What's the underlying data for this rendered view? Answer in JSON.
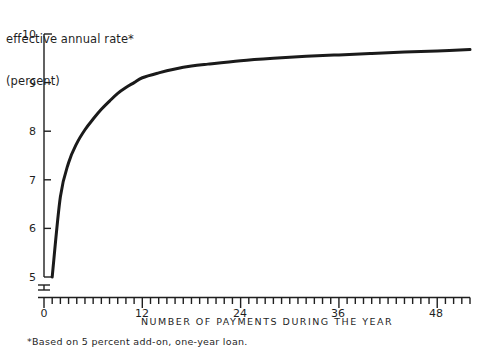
{
  "title": {
    "line1": "effective annual rate*",
    "line2": "(percent)"
  },
  "xaxis_caption": "NUMBER OF PAYMENTS DURING THE YEAR",
  "footnote": "*Based on 5 percent add-on, one-year loan.",
  "chart_data": {
    "type": "line",
    "title": "effective annual rate* (percent)",
    "subtitle": "",
    "xlabel": "NUMBER OF PAYMENTS DURING THE YEAR",
    "ylabel": "effective annual rate (percent)",
    "xlim": [
      0,
      52
    ],
    "ylim": [
      5,
      10
    ],
    "grid": false,
    "legend": null,
    "axis_break": {
      "axis": "y",
      "below": 5,
      "note": "y-axis broken between 0 and 5"
    },
    "xticks_major": [
      0,
      12,
      24,
      36,
      48
    ],
    "xtick_labels": [
      "0",
      "12",
      "24",
      "36",
      "48"
    ],
    "xticks_minor_step": 1,
    "yticks": [
      5,
      6,
      7,
      8,
      9,
      10
    ],
    "ytick_labels": [
      "5",
      "6",
      "7",
      "8",
      "9",
      "10"
    ],
    "line_color": "#1a1a1a",
    "line_width": 3.0,
    "annotations": [
      "*Based on 5 percent add-on, one-year loan."
    ],
    "series": [
      {
        "name": "effective annual rate",
        "x": [
          1,
          2,
          3,
          4,
          5,
          6,
          7,
          8,
          9,
          10,
          11,
          12,
          14,
          16,
          18,
          20,
          24,
          28,
          32,
          36,
          40,
          44,
          48,
          52
        ],
        "y": [
          5.0,
          6.65,
          7.35,
          7.75,
          8.03,
          8.25,
          8.45,
          8.62,
          8.78,
          8.9,
          9.0,
          9.1,
          9.2,
          9.28,
          9.34,
          9.38,
          9.45,
          9.5,
          9.54,
          9.57,
          9.6,
          9.63,
          9.65,
          9.68
        ]
      }
    ]
  }
}
